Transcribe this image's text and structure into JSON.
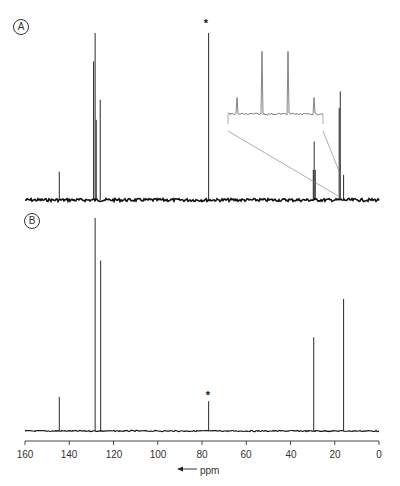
{
  "panels": {
    "a": {
      "label": "A"
    },
    "b": {
      "label": "B"
    }
  },
  "axis": {
    "unit": "ppm",
    "arrow": "←",
    "ticks": [
      "160",
      "140",
      "120",
      "100",
      "80",
      "60",
      "40",
      "20",
      "0"
    ]
  },
  "annotations": {
    "solvent_marker": "*"
  },
  "chart_data": [
    {
      "type": "line",
      "title": "A",
      "xlabel": "ppm",
      "ylabel": "",
      "xlim": [
        160,
        0
      ],
      "x_reversed": true,
      "grid": false,
      "peaks_ppm": [
        144.5,
        129.0,
        128.3,
        127.8,
        126.0,
        77.0,
        29.7,
        29.3,
        28.8,
        18.0,
        17.5,
        16.0
      ],
      "relative_heights": [
        0.17,
        0.83,
        1.0,
        0.48,
        0.6,
        1.0,
        0.18,
        0.35,
        0.18,
        0.55,
        0.65,
        0.15
      ],
      "annotations": [
        {
          "x": 77.0,
          "text": "*",
          "note": "solvent peak"
        },
        {
          "text": "inset: expanded view of 14-20 ppm region showing fine multiplet structure"
        }
      ],
      "inset_peaks_relative": [
        0.25,
        0.95,
        0.95,
        0.25
      ]
    },
    {
      "type": "line",
      "title": "B",
      "xlabel": "ppm",
      "ylabel": "",
      "xlim": [
        160,
        0
      ],
      "x_reversed": true,
      "grid": false,
      "peaks_ppm": [
        144.5,
        128.3,
        125.8,
        77.0,
        29.5,
        16.0
      ],
      "relative_heights": [
        0.16,
        1.0,
        0.8,
        0.14,
        0.44,
        0.62
      ],
      "annotations": [
        {
          "x": 77.0,
          "text": "*",
          "note": "solvent peak"
        }
      ]
    }
  ]
}
